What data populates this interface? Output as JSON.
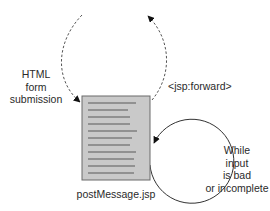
{
  "diagram": {
    "nodes": {
      "page": {
        "label": "postMessage.jsp",
        "fill": "#c9c9c9",
        "stroke": "#6a6a6a",
        "line_color": "#5a5a5a",
        "line_count": 12
      }
    },
    "edges": {
      "form_submission": {
        "label_lines": [
          "HTML",
          "form",
          "submission"
        ],
        "style": "dashed",
        "direction": "into page"
      },
      "forward": {
        "label": "<jsp:forward>",
        "style": "dashed",
        "direction": "out of page"
      },
      "loop": {
        "label_lines": [
          "While",
          "input",
          "is bad",
          "or incomplete"
        ],
        "style": "solid",
        "direction": "self-loop"
      }
    },
    "colors": {
      "arrow": "#111111",
      "dashed_line": "#555555",
      "loop_line": "#333333"
    }
  }
}
